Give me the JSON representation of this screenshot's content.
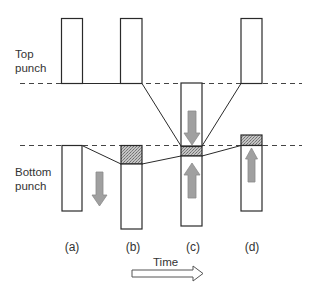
{
  "labels": {
    "top_punch_line1": "Top",
    "top_punch_line2": "punch",
    "bottom_punch_line1": "Bottom",
    "bottom_punch_line2": "punch",
    "time": "Time"
  },
  "columns": [
    {
      "id": "a",
      "label": "(a)"
    },
    {
      "id": "b",
      "label": "(b)"
    },
    {
      "id": "c",
      "label": "(c)"
    },
    {
      "id": "d",
      "label": "(d)"
    }
  ],
  "colors": {
    "outline": "#2a2a2a",
    "arrow_fill": "#a0a0a0",
    "arrow_stroke": "#8a8a8a",
    "powder": "#b8b8b8",
    "dash": "#444444",
    "text": "#333333"
  }
}
